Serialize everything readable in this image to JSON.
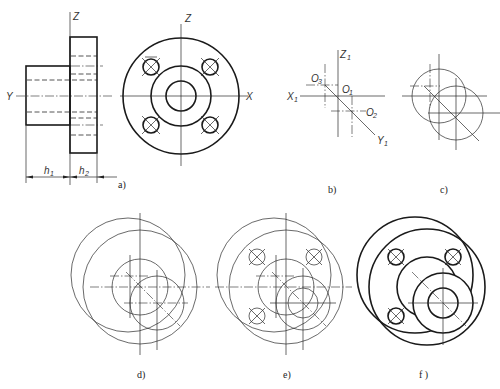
{
  "figure": {
    "panels": [
      {
        "id": "a",
        "caption": "a)",
        "description": "Front and side views of flanged part"
      },
      {
        "id": "b",
        "caption": "b)",
        "description": "Axonometric axes with centers"
      },
      {
        "id": "c",
        "caption": "c)",
        "description": "Ellipses of back and front faces"
      },
      {
        "id": "d",
        "caption": "d)",
        "description": "Flange and boss outlines"
      },
      {
        "id": "e",
        "caption": "e)",
        "description": "Bolt holes added"
      },
      {
        "id": "f",
        "caption": "f )",
        "description": "Finished isometric drawing"
      }
    ],
    "axis_labels": {
      "a_front_z": "Z",
      "a_front_y": "Y",
      "a_side_z": "Z",
      "a_side_x": "X",
      "b_z1": "Z",
      "b_z1_sub": "1",
      "b_x1": "X",
      "b_x1_sub": "1",
      "b_y1": "Y",
      "b_y1_sub": "1",
      "b_o1": "O",
      "b_o1_sub": "1",
      "b_o2": "O",
      "b_o2_sub": "2",
      "b_o3": "O",
      "b_o3_sub": "3"
    },
    "dimensions": {
      "h1": "h",
      "h1_sub": "1",
      "h2": "h",
      "h2_sub": "2"
    }
  }
}
